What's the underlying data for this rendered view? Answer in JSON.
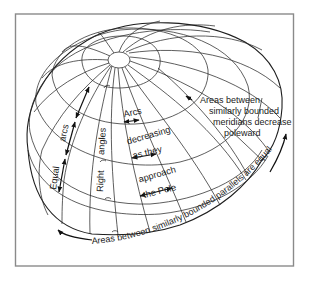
{
  "figure": {
    "labels": {
      "arcs_decreasing": [
        "Arcs",
        "decreasing",
        "as they",
        "approach",
        "the Pole"
      ],
      "equal_arcs": {
        "word1": "Equal",
        "word2": "arcs"
      },
      "right_angles": {
        "word1": "Right",
        "word2": "angles"
      },
      "meridians_note": [
        "Areas between",
        "similarly bounded",
        "meridians decrease",
        "poleward"
      ],
      "parallels_note": "Areas between similarly bounded parallels are equal"
    },
    "colors": {
      "line": "#2a2a2a",
      "frame": "#8a8a8a",
      "background": "#ffffff"
    }
  }
}
